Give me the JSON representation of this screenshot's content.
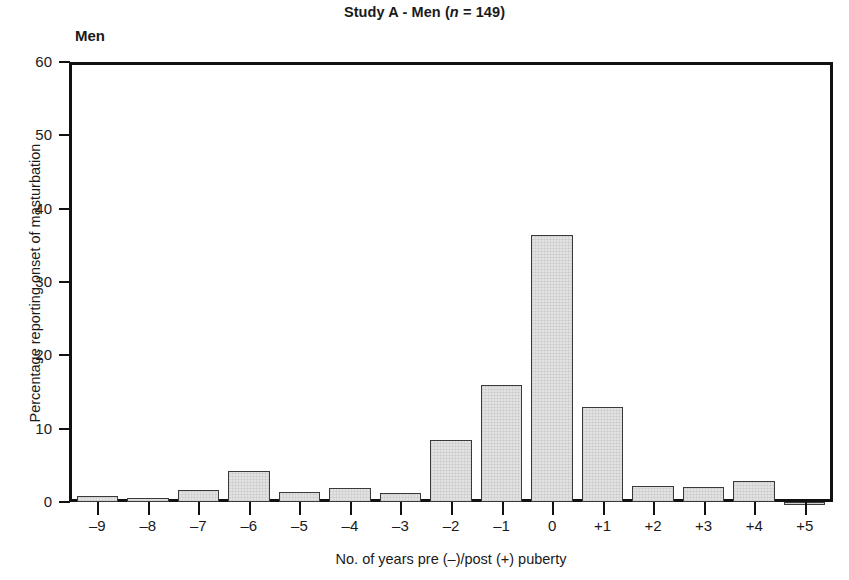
{
  "chart_data": {
    "type": "bar",
    "title": "Study A - Men (n = 149)",
    "title_prefix": "Study A - Men (",
    "title_italic": "n",
    "title_suffix": " = 149)",
    "panel_label": "Men",
    "xlabel": "No. of years pre (–)/post (+) puberty",
    "ylabel": "Percentage reporting onset of masturbation",
    "categories": [
      "–9",
      "–8",
      "–7",
      "–6",
      "–5",
      "–4",
      "–3",
      "–2",
      "–1",
      "0",
      "+1",
      "+2",
      "+3",
      "+4",
      "+5"
    ],
    "values": [
      0.8,
      0.6,
      1.7,
      4.2,
      1.4,
      1.9,
      1.2,
      8.5,
      16.0,
      36.4,
      13.0,
      2.2,
      2.1,
      2.8,
      -0.3
    ],
    "ylim": [
      0,
      60
    ],
    "yticks": [
      0,
      10,
      20,
      30,
      40,
      50,
      60
    ],
    "ytick_labels": [
      "0",
      "10",
      "20",
      "30",
      "40",
      "50",
      "60"
    ],
    "grid": false,
    "legend": "none",
    "bar_fill": "#e2e2e2",
    "bar_edge": "#3a3a3a",
    "axis_color": "#111111",
    "n": 149
  }
}
